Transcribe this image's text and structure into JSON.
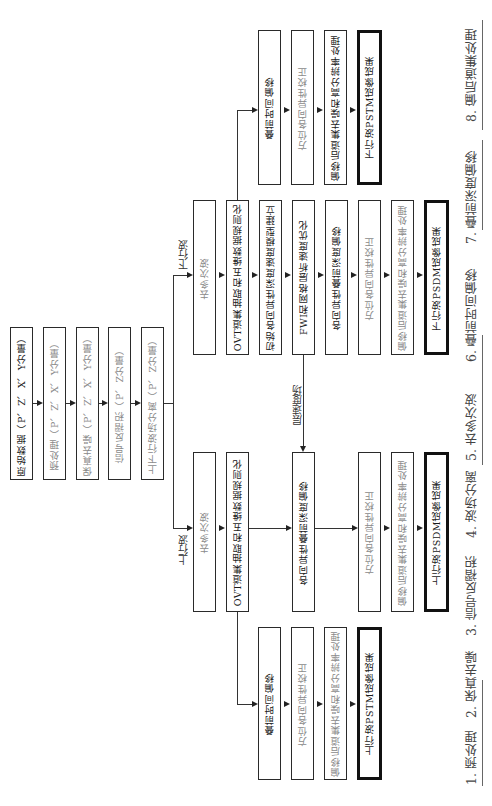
{
  "root_chain": [
    {
      "label": "原始数据（P、Z、X、Y分量）",
      "style": "dark"
    },
    {
      "label": "预处理（P、Z、X、Y分量）",
      "style": "gray"
    },
    {
      "label": "保真去噪（P、Z、X、Y分量）",
      "style": "gray"
    },
    {
      "label": "信号反褶积（P、Z分量）",
      "style": "gray"
    },
    {
      "label": "上下行波场分离（P、Z分量）",
      "style": "gray"
    }
  ],
  "branch_labels": {
    "down": "下行波",
    "up": "上行波",
    "velocity": "层速度场"
  },
  "down_psdm": [
    {
      "label": "去多次波",
      "style": "gray"
    },
    {
      "label": "OVT道集抽取和五维数据规则化",
      "style": "dark"
    },
    {
      "label": "初始各向异性深度速度模型建立",
      "style": "dark"
    },
    {
      "label": "FWI和网格层析速度优化",
      "style": "dark"
    },
    {
      "label": "各向异性叠前深度偏移",
      "style": "dark"
    },
    {
      "label": "方位各向异性校正",
      "style": "gray"
    },
    {
      "label": "偏移后道集去噪和高分辨率处理",
      "style": "gray"
    },
    {
      "label": "下行波PSDM成像成果",
      "style": "dark",
      "thick": true
    }
  ],
  "down_pstm": [
    {
      "label": "叠前时间偏移",
      "style": "dark"
    },
    {
      "label": "方位各向异性校正",
      "style": "gray"
    },
    {
      "label": "偏移后道集去噪和高分辨率处理",
      "style": "dark"
    },
    {
      "label": "下行波PSTM成像成果",
      "style": "dark",
      "thick": true
    }
  ],
  "up_psdm": [
    {
      "label": "去多次波",
      "style": "gray"
    },
    {
      "label": "OVT道集抽取和五维数据规则化",
      "style": "dark"
    },
    {
      "label": "各向异性叠前深度偏移",
      "style": "dark"
    },
    {
      "label": "方位各向异性校正",
      "style": "gray"
    },
    {
      "label": "偏移后道集去噪和高分辨率处理",
      "style": "gray"
    },
    {
      "label": "上行波PSDM成像成果",
      "style": "dark",
      "thick": true
    }
  ],
  "up_pstm": [
    {
      "label": "叠前时间偏移",
      "style": "dark"
    },
    {
      "label": "方位各向异性校正",
      "style": "gray"
    },
    {
      "label": "偏移后道集去噪和高分辨率处理",
      "style": "gray"
    },
    {
      "label": "上行波PSTM成像成果",
      "style": "dark",
      "thick": true
    }
  ],
  "legend": [
    "1. 预处理",
    "2. 保真去噪",
    "3. 信号反褶积",
    "4. 波场分离",
    "5. 去多次波",
    "6. 叠前时间偏移",
    "7. 叠前深度偏移",
    "8. 偏后道集处理"
  ]
}
